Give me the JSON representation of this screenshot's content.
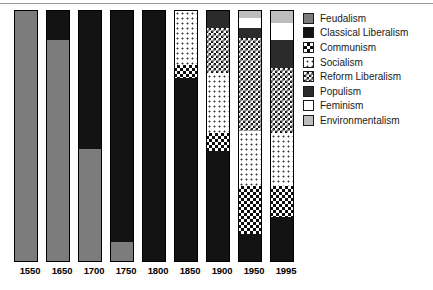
{
  "chart_data": {
    "type": "bar",
    "title": "",
    "subtitle": "",
    "xlabel": "",
    "ylabel": "",
    "ylim": [
      0,
      100
    ],
    "grid": false,
    "stacked": true,
    "stack_mode": "percent",
    "legend_position": "right",
    "categories": [
      "1550",
      "1650",
      "1700",
      "1750",
      "1800",
      "1850",
      "1900",
      "1950",
      "1995"
    ],
    "series": [
      {
        "name": "Feudalism",
        "color": "#7c7c7c",
        "pattern": "solid-gray",
        "values": [
          100,
          88,
          45,
          8,
          0,
          0,
          0,
          0,
          0
        ]
      },
      {
        "name": "Classical Liberalism",
        "color": "#131313",
        "pattern": "solid-black",
        "values": [
          0,
          12,
          55,
          92,
          100,
          73,
          44,
          11,
          18
        ]
      },
      {
        "name": "Communism",
        "color": "#0d0d0d",
        "pattern": "checkerboard-coarse",
        "values": [
          0,
          0,
          0,
          0,
          0,
          5,
          7,
          19,
          12
        ]
      },
      {
        "name": "Socialism",
        "color": "#3a3a3a",
        "pattern": "sparse-dots",
        "values": [
          0,
          0,
          0,
          0,
          0,
          22,
          24,
          22,
          21
        ]
      },
      {
        "name": "Reform Liberalism",
        "color": "#111111",
        "pattern": "checkerboard-fine",
        "values": [
          0,
          0,
          0,
          0,
          0,
          0,
          18,
          37,
          26
        ]
      },
      {
        "name": "Populism",
        "color": "#2b2b2b",
        "pattern": "solid-dark",
        "values": [
          0,
          0,
          0,
          0,
          0,
          0,
          7,
          4,
          11
        ]
      },
      {
        "name": "Feminism",
        "color": "#ffffff",
        "pattern": "solid-white",
        "values": [
          0,
          0,
          0,
          0,
          0,
          0,
          0,
          4,
          7
        ]
      },
      {
        "name": "Environmentalism",
        "color": "#bdbdbd",
        "pattern": "solid-light-gray",
        "values": [
          0,
          0,
          0,
          0,
          0,
          0,
          0,
          3,
          5
        ]
      }
    ],
    "bars": [
      {
        "category": "1550",
        "segments": [
          {
            "name": "Feudalism",
            "value": 100
          }
        ]
      },
      {
        "category": "1650",
        "segments": [
          {
            "name": "Classical Liberalism",
            "value": 12
          },
          {
            "name": "Feudalism",
            "value": 88
          }
        ]
      },
      {
        "category": "1700",
        "segments": [
          {
            "name": "Classical Liberalism",
            "value": 55
          },
          {
            "name": "Feudalism",
            "value": 45
          }
        ]
      },
      {
        "category": "1750",
        "segments": [
          {
            "name": "Classical Liberalism",
            "value": 92
          },
          {
            "name": "Feudalism",
            "value": 8
          }
        ]
      },
      {
        "category": "1800",
        "segments": [
          {
            "name": "Classical Liberalism",
            "value": 100
          }
        ]
      },
      {
        "category": "1850",
        "segments": [
          {
            "name": "Socialism",
            "value": 22
          },
          {
            "name": "Communism",
            "value": 5
          },
          {
            "name": "Classical Liberalism",
            "value": 73
          }
        ]
      },
      {
        "category": "1900",
        "segments": [
          {
            "name": "Feminism",
            "value": 0
          },
          {
            "name": "Populism",
            "value": 7
          },
          {
            "name": "Reform Liberalism",
            "value": 18
          },
          {
            "name": "Socialism",
            "value": 24
          },
          {
            "name": "Communism",
            "value": 7
          },
          {
            "name": "Classical Liberalism",
            "value": 44
          }
        ]
      },
      {
        "category": "1950",
        "segments": [
          {
            "name": "Environmentalism",
            "value": 3
          },
          {
            "name": "Feminism",
            "value": 4
          },
          {
            "name": "Populism",
            "value": 4
          },
          {
            "name": "Reform Liberalism",
            "value": 37
          },
          {
            "name": "Socialism",
            "value": 22
          },
          {
            "name": "Communism",
            "value": 19
          },
          {
            "name": "Classical Liberalism",
            "value": 11
          }
        ]
      },
      {
        "category": "1995",
        "segments": [
          {
            "name": "Environmentalism",
            "value": 5
          },
          {
            "name": "Feminism",
            "value": 7
          },
          {
            "name": "Populism",
            "value": 11
          },
          {
            "name": "Reform Liberalism",
            "value": 26
          },
          {
            "name": "Socialism",
            "value": 21
          },
          {
            "name": "Communism",
            "value": 12
          },
          {
            "name": "Classical Liberalism",
            "value": 18
          }
        ]
      }
    ]
  },
  "legend": {
    "items": [
      {
        "label": "Feudalism",
        "key": "feudalism"
      },
      {
        "label": "Classical Liberalism",
        "key": "classical-liberalism"
      },
      {
        "label": "Communism",
        "key": "communism"
      },
      {
        "label": "Socialism",
        "key": "socialism"
      },
      {
        "label": "Reform Liberalism",
        "key": "reform-liberalism"
      },
      {
        "label": "Populism",
        "key": "populism"
      },
      {
        "label": "Feminism",
        "key": "feminism"
      },
      {
        "label": "Environmentalism",
        "key": "environmentalism"
      }
    ]
  }
}
